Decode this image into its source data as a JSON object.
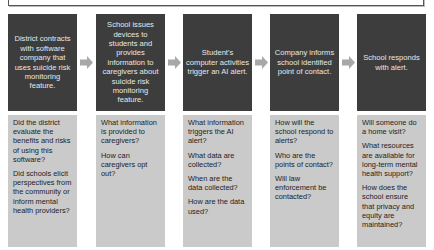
{
  "diagram": {
    "type": "process-flow",
    "colors": {
      "step_box": "#3d3d3d",
      "step_text": "#e8e8e8",
      "question_box": "#cacaca",
      "question_text": "#1d1d1d",
      "arrow": "#a8a8a8"
    },
    "steps": [
      {
        "label": "District contracts with software company that uses suicide risk monitoring feature.",
        "questions": [
          "Did the district evaluate the benefits and risks of using this software?",
          "Did schools elicit perspectives from the community or inform mental health providers?"
        ]
      },
      {
        "label": "School issues devices to students and provides information to caregivers about suicide risk monitoring feature.",
        "questions": [
          "What information is provided to caregivers?",
          "How can caregivers opt out?"
        ]
      },
      {
        "label": "Student's computer activities trigger an AI alert.",
        "questions": [
          "What information triggers the AI alert?",
          "What data are collected?",
          "When are the data collected?",
          "How are the data used?"
        ]
      },
      {
        "label": "Company informs school identified point of contact.",
        "questions": [
          "How will the school respond to alerts?",
          "Who are the points of contact?",
          "Will law enforcement be contacted?"
        ]
      },
      {
        "label": "School responds with alert.",
        "questions": [
          "Will someone do a home visit?",
          "What resources are available for long-term mental health support?",
          "How does the school ensure that privacy and equity are maintained?"
        ]
      }
    ],
    "arrows": [
      "right-arrow-icon",
      "right-arrow-icon",
      "right-arrow-icon",
      "right-arrow-icon"
    ]
  }
}
